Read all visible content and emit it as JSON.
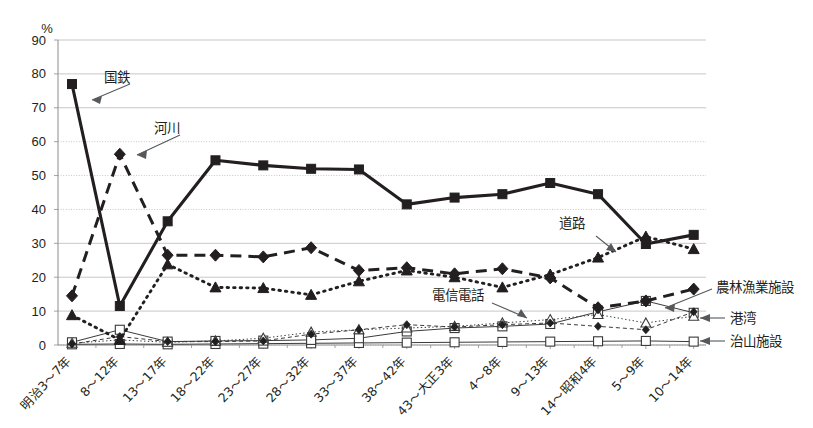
{
  "chart_data": {
    "type": "line",
    "title": "",
    "xlabel": "",
    "ylabel": "%",
    "ylim": [
      0,
      90
    ],
    "ytick_step": 10,
    "yticks": [
      "0",
      "10",
      "20",
      "30",
      "40",
      "50",
      "60",
      "70",
      "80",
      "90"
    ],
    "grid": true,
    "legend_position": "inline-annotations",
    "categories": [
      "明治3〜7年",
      "8〜12年",
      "13〜17年",
      "18〜22年",
      "23〜27年",
      "28〜32年",
      "33〜37年",
      "38〜42年",
      "43〜大正3年",
      "4〜8年",
      "9〜13年",
      "14〜昭和4年",
      "5〜9年",
      "10〜14年"
    ],
    "series": [
      {
        "name": "国鉄",
        "style": "solid-thick",
        "marker": "square-filled",
        "values": [
          77.0,
          11.5,
          36.5,
          54.5,
          53.0,
          52.0,
          51.8,
          41.5,
          43.5,
          44.5,
          47.8,
          44.5,
          29.8,
          32.5
        ]
      },
      {
        "name": "河川",
        "style": "dashed",
        "marker": "diamond-filled",
        "values": [
          14.5,
          56.3,
          26.5,
          26.5,
          26.0,
          28.7,
          22.0,
          22.8,
          21.0,
          22.5,
          19.8,
          11.0,
          13.0,
          16.5
        ]
      },
      {
        "name": "道路",
        "style": "dotted",
        "marker": "triangle-filled",
        "values": [
          8.8,
          1.5,
          23.8,
          17.0,
          16.8,
          14.8,
          18.8,
          22.0,
          20.0,
          17.0,
          20.8,
          25.8,
          32.0,
          28.3
        ]
      },
      {
        "name": "農林漁業施設",
        "style": "thin-dashed",
        "marker": "diamond-small",
        "values": [
          0.3,
          2.5,
          1.0,
          1.0,
          1.2,
          3.2,
          4.5,
          6.0,
          5.3,
          6.0,
          6.5,
          5.5,
          4.5,
          9.8
        ]
      },
      {
        "name": "電信電話",
        "style": "thin-dotted",
        "marker": "triangle-open",
        "values": [
          0.5,
          1.5,
          0.8,
          1.2,
          2.0,
          3.8,
          4.5,
          5.0,
          5.5,
          6.5,
          7.5,
          9.0,
          6.5,
          8.5
        ]
      },
      {
        "name": "港湾",
        "style": "thin-solid",
        "marker": "square-open",
        "values": [
          0.8,
          4.5,
          1.0,
          1.2,
          1.3,
          1.5,
          2.0,
          4.0,
          5.0,
          5.5,
          6.2,
          9.8,
          13.0,
          9.5
        ]
      },
      {
        "name": "治山施設",
        "style": "thin-solid-2",
        "marker": "square-open",
        "values": [
          0.2,
          0.3,
          0.2,
          0.3,
          0.4,
          0.5,
          0.6,
          0.7,
          0.8,
          0.9,
          1.0,
          1.1,
          1.2,
          1.0
        ]
      }
    ],
    "annotations": [
      {
        "label": "国鉄",
        "anchor": "series-kokutetsu"
      },
      {
        "label": "河川",
        "anchor": "series-kasen"
      },
      {
        "label": "道路",
        "anchor": "series-doro"
      },
      {
        "label": "電信電話",
        "anchor": "series-denshin-denwa"
      },
      {
        "label": "農林漁業施設",
        "anchor": "series-norin-gyogyo"
      },
      {
        "label": "港湾",
        "anchor": "series-kowan"
      },
      {
        "label": "治山施設",
        "anchor": "series-chisan"
      }
    ]
  }
}
